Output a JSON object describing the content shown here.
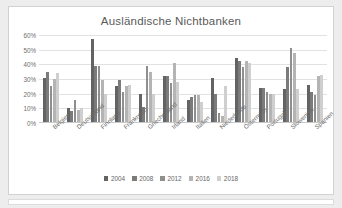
{
  "chart_data": {
    "type": "bar",
    "title": "Ausländische Nichtbanken",
    "xlabel": "",
    "ylabel": "",
    "ylim": [
      0,
      60
    ],
    "ytick_labels": [
      "60%",
      "50%",
      "40%",
      "30%",
      "20%",
      "10%",
      "0%"
    ],
    "ytick_values": [
      60,
      50,
      40,
      30,
      20,
      10,
      0
    ],
    "grid": true,
    "legend_position": "bottom",
    "categories": [
      "Belgien",
      "Deutschland",
      "Finnland",
      "Frankreich",
      "Griechenland",
      "Irland",
      "Italien",
      "Niederlande",
      "Österreich",
      "Portugal",
      "Slowenien",
      "Spanien"
    ],
    "series": [
      {
        "name": "2004",
        "color": "#636363",
        "values": [
          31,
          10,
          57,
          25,
          20,
          32,
          16,
          31,
          44,
          24,
          23,
          26
        ]
      },
      {
        "name": "2008",
        "color": "#7b7b7b",
        "values": [
          35,
          8,
          39,
          29,
          11,
          32,
          18,
          20,
          42,
          24,
          38,
          21
        ]
      },
      {
        "name": "2012",
        "color": "#8f8f8f",
        "values": [
          25,
          16,
          39,
          21,
          39,
          27,
          19,
          7,
          38,
          21,
          51,
          19
        ]
      },
      {
        "name": "2016",
        "color": "#b4b4b4",
        "values": [
          30,
          9,
          29,
          25,
          35,
          41,
          19,
          5,
          42,
          20,
          48,
          32
        ]
      },
      {
        "name": "2018",
        "color": "#cfcfcf",
        "values": [
          34,
          10,
          20,
          26,
          20,
          28,
          14,
          25,
          41,
          20,
          23,
          33
        ]
      }
    ]
  }
}
